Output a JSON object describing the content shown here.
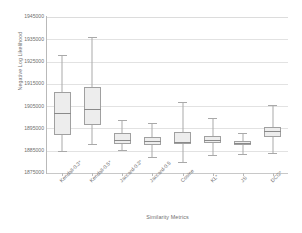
{
  "chart_data": {
    "type": "box",
    "title": "",
    "xlabel": "Similarity Metrics",
    "ylabel": "Negative Log Likelihood",
    "ylim": [
      1875000,
      1945000
    ],
    "ytick_step": 10000,
    "yticks": [
      1945000,
      1935000,
      1925000,
      1915000,
      1905000,
      1895000,
      1885000,
      1875000
    ],
    "ytick_labels": [
      "1945000",
      "1935000",
      "1925000",
      "1915000",
      "1905000",
      "1895000",
      "1885000",
      "1875000"
    ],
    "grid": true,
    "legend": "none",
    "categories": [
      "Kendall-0.3*",
      "Kendall-0.5*",
      "Jaccard-0.3*",
      "Jaccard-0.5",
      "Cosine",
      "KL*",
      "JS",
      "DCG*"
    ],
    "boxes": [
      {
        "category": "Kendall-0.3*",
        "whisker_low": 1885000,
        "q1": 1892000,
        "median": 1902000,
        "q3": 1911500,
        "whisker_high": 1928000
      },
      {
        "category": "Kendall-0.5*",
        "whisker_low": 1888000,
        "q1": 1896500,
        "median": 1903500,
        "q3": 1913500,
        "whisker_high": 1936000
      },
      {
        "category": "Jaccard-0.3*",
        "whisker_low": 1885500,
        "q1": 1888000,
        "median": 1890000,
        "q3": 1893000,
        "whisker_high": 1899000
      },
      {
        "category": "Jaccard-0.5",
        "whisker_low": 1882000,
        "q1": 1887500,
        "median": 1889500,
        "q3": 1891000,
        "whisker_high": 1897500
      },
      {
        "category": "Cosine",
        "whisker_low": 1880000,
        "q1": 1888000,
        "median": 1889000,
        "q3": 1893500,
        "whisker_high": 1907000
      },
      {
        "category": "KL*",
        "whisker_low": 1883000,
        "q1": 1888500,
        "median": 1890000,
        "q3": 1891500,
        "whisker_high": 1899500
      },
      {
        "category": "JS",
        "whisker_low": 1883500,
        "q1": 1887500,
        "median": 1888300,
        "q3": 1889500,
        "whisker_high": 1893000
      },
      {
        "category": "DCG*",
        "whisker_low": 1884000,
        "q1": 1891000,
        "median": 1894000,
        "q3": 1895500,
        "whisker_high": 1905500
      }
    ],
    "colors": {
      "box_fill": "#ededed",
      "box_border": "#a0a0a0",
      "whisker": "#a9a9a9",
      "median": "#8a8a8a",
      "gridline": "#e2e2e2",
      "axis": "#b9b9b9",
      "text": "#6f6f6f",
      "background": "#ffffff"
    }
  }
}
